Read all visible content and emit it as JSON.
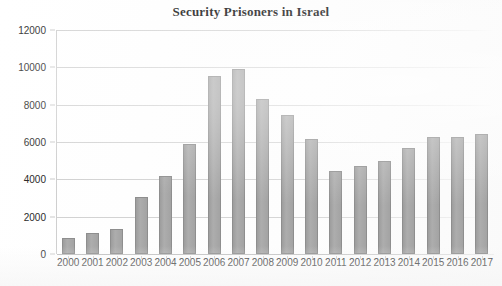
{
  "chart_data": {
    "type": "bar",
    "title": "Security Prisoners in Israel",
    "xlabel": "",
    "ylabel": "",
    "categories": [
      "2000",
      "2001",
      "2002",
      "2003",
      "2004",
      "2005",
      "2006",
      "2007",
      "2008",
      "2009",
      "2010",
      "2011",
      "2012",
      "2013",
      "2014",
      "2015",
      "2016",
      "2017"
    ],
    "values": [
      850,
      1100,
      1350,
      3050,
      4200,
      5900,
      9550,
      9900,
      8300,
      7450,
      6150,
      4450,
      4700,
      5000,
      5700,
      6250,
      6250,
      6450
    ],
    "ylim": [
      0,
      12000
    ],
    "yticks": [
      0,
      2000,
      4000,
      6000,
      8000,
      10000,
      12000
    ],
    "ytick_labels": [
      "0",
      "2000",
      "4000",
      "6000",
      "8000",
      "10000",
      "12000"
    ],
    "grid": true,
    "legend": false,
    "legend_position": "none",
    "bar_color": "#a5a5a5",
    "bar_border_color": "#8e8e8e",
    "gridline_color": "#d4d4d4",
    "text_color": "#2b2b2b",
    "background_color": "#ffffff"
  }
}
